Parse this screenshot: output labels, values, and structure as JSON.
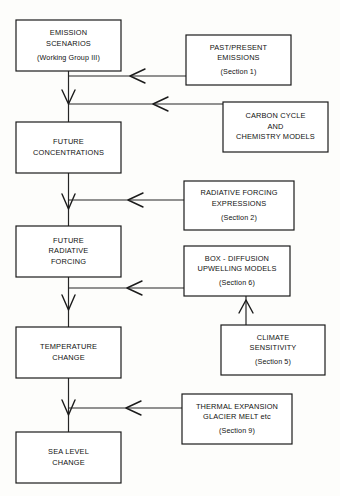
{
  "diagram": {
    "background_color": "#fdfdfb",
    "line_color": "#262626",
    "box_fill": "#ffffff",
    "box_stroke": "#1b1b1b",
    "boxes": [
      {
        "id": "emission-scenarios",
        "lines": [
          "EMISSION",
          "SCENARIOS"
        ],
        "note": "(Working Group III)",
        "x": 16,
        "y": 20,
        "w": 105,
        "h": 51
      },
      {
        "id": "past-present-emissions",
        "lines": [
          "PAST/PRESENT",
          "EMISSIONS"
        ],
        "note": "(Section  1)",
        "x": 186,
        "y": 35,
        "w": 105,
        "h": 50
      },
      {
        "id": "carbon-cycle-chemistry-models",
        "lines": [
          "CARBON CYCLE",
          "AND",
          "CHEMISTRY MODELS"
        ],
        "note": "",
        "x": 223,
        "y": 102,
        "w": 105,
        "h": 50
      },
      {
        "id": "future-concentrations",
        "lines": [
          "FUTURE",
          "CONCENTRATIONS"
        ],
        "note": "",
        "x": 16,
        "y": 122,
        "w": 105,
        "h": 51
      },
      {
        "id": "radiative-forcing-expressions",
        "lines": [
          "RADIATIVE FORCING",
          "EXPRESSIONS"
        ],
        "note": "(Section  2)",
        "x": 184,
        "y": 181,
        "w": 110,
        "h": 49
      },
      {
        "id": "future-radiative-forcing",
        "lines": [
          "FUTURE",
          "RADIATIVE",
          "FORCING"
        ],
        "note": "",
        "x": 16,
        "y": 226,
        "w": 105,
        "h": 51
      },
      {
        "id": "box-diffusion-upwelling-models",
        "lines": [
          "BOX - DIFFUSION",
          "UPWELLING MODELS"
        ],
        "note": "(Section  6)",
        "x": 184,
        "y": 246,
        "w": 106,
        "h": 50
      },
      {
        "id": "climate-sensitivity",
        "lines": [
          "CLIMATE",
          "SENSITIVITY"
        ],
        "note": "(Section  5)",
        "x": 221,
        "y": 325,
        "w": 104,
        "h": 50
      },
      {
        "id": "temperature-change",
        "lines": [
          "TEMPERATURE",
          "CHANGE"
        ],
        "note": "",
        "x": 16,
        "y": 327,
        "w": 105,
        "h": 51
      },
      {
        "id": "thermal-expansion-glacier-melt",
        "lines": [
          "THERMAL EXPANSION",
          "GLACIER MELT etc"
        ],
        "note": "(Section  9)",
        "x": 182,
        "y": 394,
        "w": 110,
        "h": 50
      },
      {
        "id": "sea-level-change",
        "lines": [
          "SEA LEVEL",
          "CHANGE"
        ],
        "note": "",
        "x": 16,
        "y": 432,
        "w": 105,
        "h": 51
      }
    ],
    "flow_sequence": [
      "EMISSION SCENARIOS",
      "FUTURE CONCENTRATIONS",
      "FUTURE RADIATIVE FORCING",
      "TEMPERATURE CHANGE",
      "SEA LEVEL CHANGE"
    ],
    "inputs": [
      {
        "from": "PAST/PRESENT EMISSIONS",
        "into": "FUTURE CONCENTRATIONS"
      },
      {
        "from": "CARBON CYCLE AND CHEMISTRY MODELS",
        "into": "FUTURE CONCENTRATIONS"
      },
      {
        "from": "RADIATIVE FORCING EXPRESSIONS",
        "into": "FUTURE RADIATIVE FORCING"
      },
      {
        "from": "BOX - DIFFUSION UPWELLING MODELS",
        "into": "TEMPERATURE CHANGE"
      },
      {
        "from": "CLIMATE SENSITIVITY",
        "into": "BOX - DIFFUSION UPWELLING MODELS"
      },
      {
        "from": "THERMAL EXPANSION GLACIER MELT etc",
        "into": "SEA LEVEL CHANGE"
      }
    ]
  }
}
